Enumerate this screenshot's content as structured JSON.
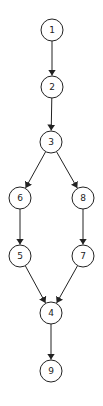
{
  "diagram": {
    "type": "directed-graph",
    "node_radius": 11,
    "stroke_color": "#222222",
    "background": "#ffffff",
    "nodes": [
      {
        "id": "1",
        "label": "1",
        "x": 52,
        "y": 30
      },
      {
        "id": "2",
        "label": "2",
        "x": 52,
        "y": 87
      },
      {
        "id": "3",
        "label": "3",
        "x": 51,
        "y": 142
      },
      {
        "id": "6",
        "label": "6",
        "x": 20,
        "y": 198
      },
      {
        "id": "8",
        "label": "8",
        "x": 83,
        "y": 198
      },
      {
        "id": "5",
        "label": "5",
        "x": 20,
        "y": 256
      },
      {
        "id": "7",
        "label": "7",
        "x": 83,
        "y": 256
      },
      {
        "id": "4",
        "label": "4",
        "x": 51,
        "y": 313
      },
      {
        "id": "9",
        "label": "9",
        "x": 51,
        "y": 371
      }
    ],
    "edges": [
      {
        "from": "1",
        "to": "2"
      },
      {
        "from": "2",
        "to": "3"
      },
      {
        "from": "3",
        "to": "6"
      },
      {
        "from": "3",
        "to": "8"
      },
      {
        "from": "6",
        "to": "5"
      },
      {
        "from": "8",
        "to": "7"
      },
      {
        "from": "5",
        "to": "4"
      },
      {
        "from": "7",
        "to": "4"
      },
      {
        "from": "4",
        "to": "9"
      }
    ]
  }
}
